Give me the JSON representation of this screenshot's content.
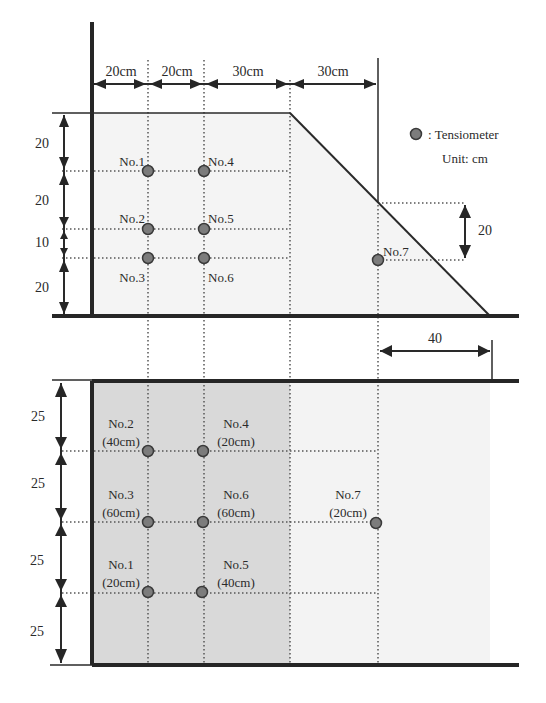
{
  "legend": {
    "sensor_label": ": Tensiometer",
    "unit_label": "Unit: cm",
    "sensor_color": "#7c7c7c"
  },
  "cross_section": {
    "top_dimensions": [
      "20cm",
      "20cm",
      "30cm",
      "30cm"
    ],
    "left_dimensions": [
      "20",
      "20",
      "10",
      "20"
    ],
    "right_dimension": "20",
    "bottom_dimension": "40",
    "sensors": [
      {
        "id": "No.1"
      },
      {
        "id": "No.2"
      },
      {
        "id": "No.3"
      },
      {
        "id": "No.4"
      },
      {
        "id": "No.5"
      },
      {
        "id": "No.6"
      },
      {
        "id": "No.7"
      }
    ]
  },
  "plan_view": {
    "left_dimensions": [
      "25",
      "25",
      "25",
      "25"
    ],
    "sensors": [
      {
        "id": "No.2",
        "depth": "(40cm)"
      },
      {
        "id": "No.4",
        "depth": "(20cm)"
      },
      {
        "id": "No.3",
        "depth": "(60cm)"
      },
      {
        "id": "No.6",
        "depth": "(60cm)"
      },
      {
        "id": "No.1",
        "depth": "(20cm)"
      },
      {
        "id": "No.5",
        "depth": "(40cm)"
      },
      {
        "id": "No.7",
        "depth": "(20cm)"
      }
    ],
    "shade_dark": "#d9d9d9",
    "shade_light": "#f3f3f3"
  }
}
